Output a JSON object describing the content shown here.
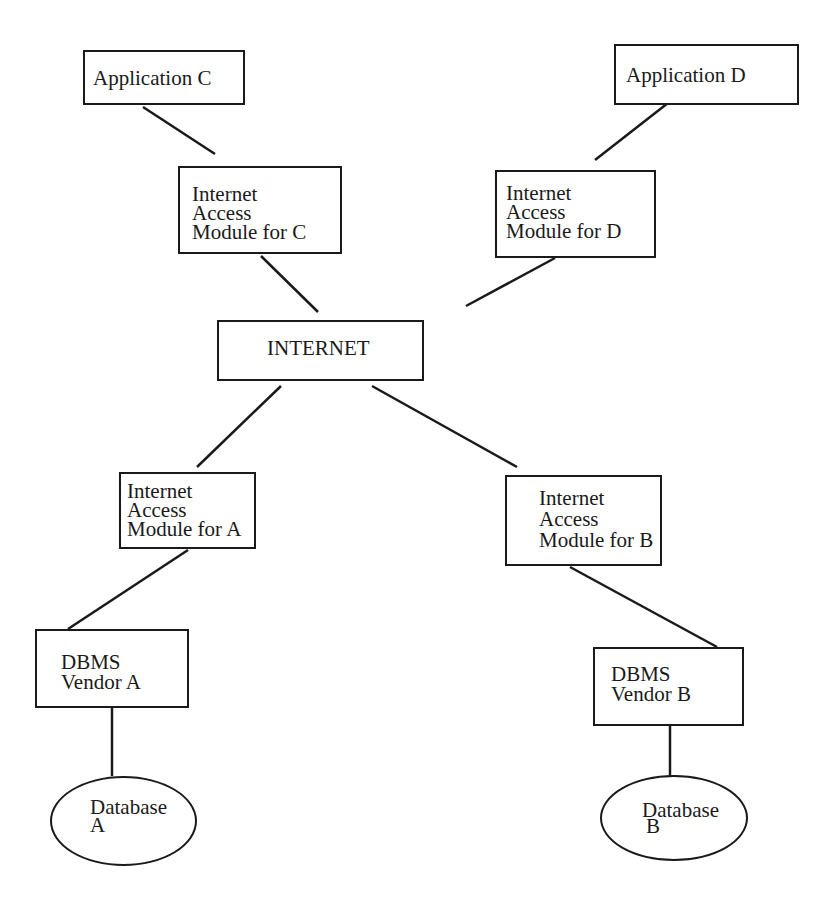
{
  "diagram": {
    "type": "network-architecture",
    "nodes": {
      "app_c": {
        "label": "Application C",
        "shape": "rectangle"
      },
      "app_d": {
        "label": "Application D",
        "shape": "rectangle"
      },
      "iam_c": {
        "lines": [
          "Internet",
          "Access",
          "Module for C"
        ],
        "shape": "rectangle"
      },
      "iam_d": {
        "lines": [
          "Internet",
          "Access",
          "Module for D"
        ],
        "shape": "rectangle"
      },
      "internet": {
        "label": "INTERNET",
        "shape": "rectangle"
      },
      "iam_a": {
        "lines": [
          "Internet",
          "Access",
          "Module for A"
        ],
        "shape": "rectangle"
      },
      "iam_b": {
        "lines": [
          "Internet",
          "Access",
          "Module for B"
        ],
        "shape": "rectangle"
      },
      "dbms_a": {
        "lines": [
          "DBMS",
          "Vendor A"
        ],
        "shape": "rectangle"
      },
      "dbms_b": {
        "lines": [
          "DBMS",
          "Vendor B"
        ],
        "shape": "rectangle"
      },
      "db_a": {
        "lines": [
          "Database",
          "A"
        ],
        "shape": "ellipse"
      },
      "db_b": {
        "lines": [
          "Database",
          "B"
        ],
        "shape": "ellipse"
      }
    },
    "edges": [
      [
        "app_c",
        "iam_c"
      ],
      [
        "app_d",
        "iam_d"
      ],
      [
        "iam_c",
        "internet"
      ],
      [
        "iam_d",
        "internet"
      ],
      [
        "internet",
        "iam_a"
      ],
      [
        "internet",
        "iam_b"
      ],
      [
        "iam_a",
        "dbms_a"
      ],
      [
        "iam_b",
        "dbms_b"
      ],
      [
        "dbms_a",
        "db_a"
      ],
      [
        "dbms_b",
        "db_b"
      ]
    ],
    "line_color": "#1a1a1a"
  }
}
